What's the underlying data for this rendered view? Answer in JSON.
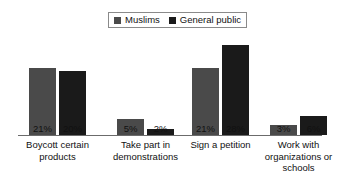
{
  "chart_data": {
    "type": "bar",
    "title": "",
    "subtitle": "",
    "xlabel": "",
    "ylabel": "",
    "ylim": [
      0,
      30
    ],
    "grid": false,
    "legend_position": "top",
    "value_suffix": "%",
    "categories": [
      "Boycott certain products",
      "Take part in demonstrations",
      "Sign a petition",
      "Work with organizations or schools"
    ],
    "category_lines": [
      [
        "Boycott certain",
        "products"
      ],
      [
        "Take part in",
        "demonstrations"
      ],
      [
        "Sign a petition"
      ],
      [
        "Work with",
        "organizations or",
        "schools"
      ]
    ],
    "series": [
      {
        "name": "Muslims",
        "color": "#4a4a4a",
        "values": [
          21,
          5,
          21,
          3
        ],
        "labels": [
          "21%",
          "5%",
          "21%",
          "3%"
        ]
      },
      {
        "name": "General public",
        "color": "#1a1a1a",
        "values": [
          20,
          2,
          28,
          6
        ],
        "labels": [
          "20%",
          "2%",
          "28%",
          "6%"
        ]
      }
    ]
  },
  "legend": {
    "entries": [
      {
        "label": "Muslims",
        "color": "#4a4a4a"
      },
      {
        "label": "General public",
        "color": "#1a1a1a"
      }
    ]
  },
  "axis": {
    "baseline_color": "#6b6b6b"
  }
}
